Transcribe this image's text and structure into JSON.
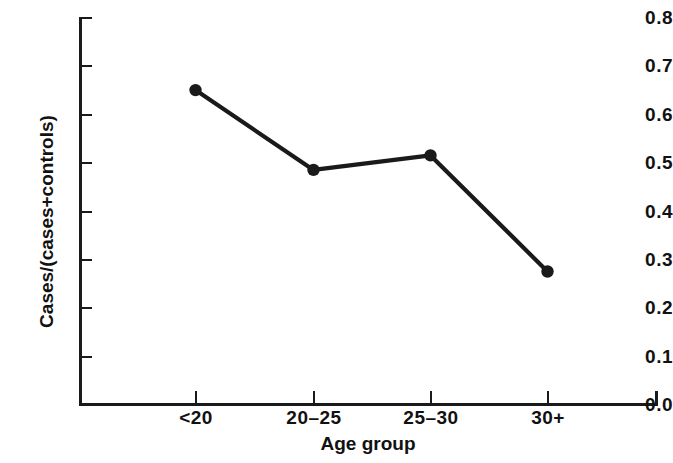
{
  "chart_data": {
    "type": "line",
    "title": "",
    "subtitle": "",
    "xlabel": "Age group",
    "ylabel": "Cases/(cases+controls)",
    "categories": [
      "<20",
      "20–25",
      "25–30",
      "30+"
    ],
    "values": [
      0.65,
      0.485,
      0.515,
      0.275
    ],
    "series": [
      {
        "name": "Cases/(cases+controls)",
        "values": [
          0.65,
          0.485,
          0.515,
          0.275
        ]
      }
    ],
    "ylim": [
      0.0,
      0.8
    ],
    "ytick_labels": [
      "0.8",
      "0.7",
      "0.6",
      "0.5",
      "0.4",
      "0.3",
      "0.2",
      "0.1",
      "0.0"
    ],
    "ytick_values": [
      0.8,
      0.7,
      0.6,
      0.5,
      0.4,
      0.3,
      0.2,
      0.1,
      0.0
    ],
    "xtick_labels": [
      "<20",
      "20–25",
      "25–30",
      "30+"
    ],
    "grid": false,
    "legend": false,
    "legend_position": "none",
    "marker": "filled-circle",
    "line_color": "#1a1a1a",
    "marker_color": "#1a1a1a",
    "background_color": "#ffffff",
    "annotations": []
  },
  "axis": {
    "x_title": "Age group",
    "y_title": "Cases/(cases+controls)"
  }
}
